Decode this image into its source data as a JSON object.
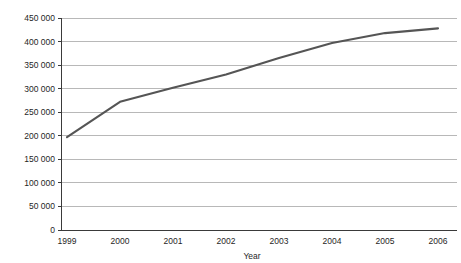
{
  "chart_data": {
    "type": "line",
    "title": "",
    "subtitle": "",
    "xlabel": "Year",
    "ylabel": "",
    "x": [
      1999,
      2000,
      2001,
      2002,
      2003,
      2004,
      2005,
      2006
    ],
    "categories": [
      "1999",
      "2000",
      "2001",
      "2002",
      "2003",
      "2004",
      "2005",
      "2006"
    ],
    "series": [
      {
        "name": "",
        "values": [
          197000,
          272000,
          302000,
          330000,
          365000,
          397000,
          418000,
          428000
        ]
      }
    ],
    "ylim": [
      0,
      450000
    ],
    "yticks": [
      0,
      50000,
      100000,
      150000,
      200000,
      250000,
      300000,
      350000,
      400000,
      450000
    ],
    "ytick_labels": [
      "0",
      "50 000",
      "100 000",
      "150 000",
      "200 000",
      "250 000",
      "300 000",
      "350 000",
      "400 000",
      "450 000"
    ],
    "xtick_labels": [
      "1999",
      "2000",
      "2001",
      "2002",
      "2003",
      "2004",
      "2005",
      "2006"
    ],
    "grid": true,
    "grid_axis": "y",
    "legend": false,
    "legend_position": "none",
    "line_color": "#555555",
    "grid_color": "#9a9a9a",
    "axis_color": "#3a3a3a",
    "background_color": "#ffffff"
  },
  "figure": {
    "title_cropped": "",
    "x_axis_title": "Year"
  }
}
